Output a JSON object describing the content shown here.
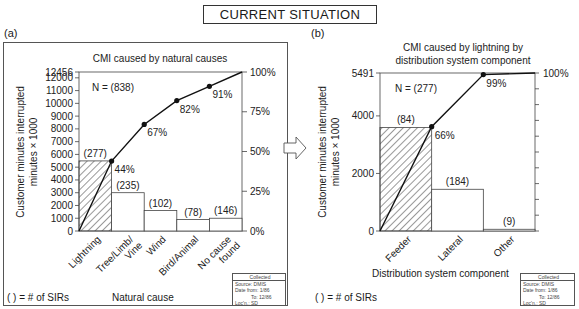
{
  "page": {
    "title": "CURRENT SITUATION",
    "arrow_icon": "right-arrow-icon"
  },
  "panels": [
    {
      "label": "(a)",
      "footnote": "( ) = # of SIRs",
      "xlabel": "Natural cause",
      "source_box": {
        "header": "Collected",
        "lines": [
          "Source: DMIS",
          "Date from: 1/86",
          "To: 12/86",
          "Loc'n.: SD"
        ]
      }
    },
    {
      "label": "(b)",
      "footnote": "( ) = # of SIRs",
      "xlabel": "Distribution system component",
      "source_box": {
        "header": "Collected",
        "lines": [
          "Source: DMIS",
          "Date from: 1/86",
          "To: 12/86",
          "Loc'n.: SD"
        ]
      }
    }
  ],
  "chart_data": [
    {
      "type": "bar",
      "subtype": "pareto",
      "title": "CMI caused by natural causes",
      "annotation": "N = (838)",
      "xlabel": "Natural cause",
      "ylabel": "Customer minutes interrupted minutes × 1000",
      "y2label": "",
      "categories": [
        "Lightning",
        "Tree/Limb/ Vine",
        "Wind",
        "Bird/Animal",
        "No cause found"
      ],
      "series": [
        {
          "name": "CMI (minutes × 1000)",
          "values": [
            5491,
            3000,
            1600,
            900,
            1000
          ]
        },
        {
          "name": "# of SIRs",
          "values": [
            277,
            235,
            102,
            78,
            146
          ]
        },
        {
          "name": "Cumulative %",
          "values": [
            44,
            67,
            82,
            91,
            100
          ]
        }
      ],
      "bar_labels": [
        "(277)",
        "(235)",
        "(102)",
        "(78)",
        "(146)"
      ],
      "cum_labels": [
        "44%",
        "67%",
        "82%",
        "91%",
        ""
      ],
      "ylim": [
        0,
        12456
      ],
      "yticks": [
        0,
        1000,
        2000,
        3000,
        4000,
        5000,
        6000,
        7000,
        8000,
        9000,
        10000,
        11000,
        12000,
        12456
      ],
      "y2ticks": [
        "0%",
        "25%",
        "50%",
        "75%",
        "100%"
      ],
      "hatched_category": "Lightning",
      "grid": false,
      "legend": "none"
    },
    {
      "type": "bar",
      "subtype": "pareto",
      "title": "CMI caused by lightning by distribution system component",
      "title_lines": [
        "CMI caused by lightning by",
        "distribution system component"
      ],
      "annotation": "N = (277)",
      "xlabel": "Distribution system component",
      "ylabel": "Customer minutes interrupted minutes × 1000",
      "categories": [
        "Feeder",
        "Lateral",
        "Other"
      ],
      "series": [
        {
          "name": "CMI (minutes × 1000)",
          "values": [
            3600,
            1450,
            60
          ]
        },
        {
          "name": "# of SIRs",
          "values": [
            84,
            184,
            9
          ]
        },
        {
          "name": "Cumulative %",
          "values": [
            66,
            99,
            100
          ]
        }
      ],
      "bar_labels": [
        "(84)",
        "(184)",
        "(9)"
      ],
      "cum_labels": [
        "66%",
        "99%",
        "100%"
      ],
      "ylim": [
        0,
        5491
      ],
      "yticks": [
        0,
        2000,
        4000,
        5491
      ],
      "y2ticks": [
        "100%"
      ],
      "hatched_category": "Feeder",
      "grid": false,
      "legend": "none"
    }
  ]
}
